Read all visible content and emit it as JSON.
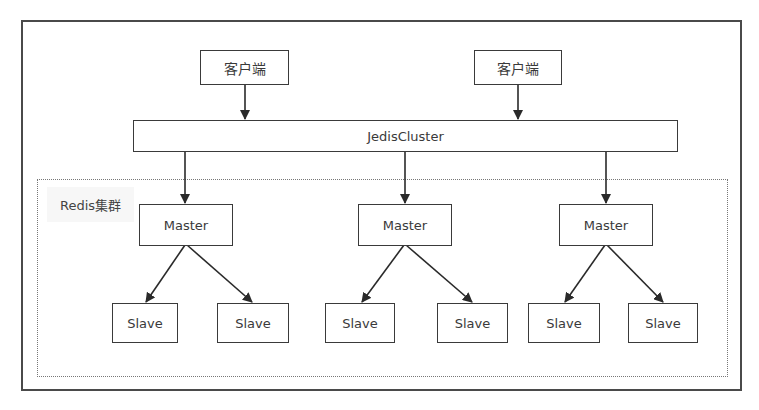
{
  "diagram": {
    "clients": [
      {
        "label": "客户端"
      },
      {
        "label": "客户端"
      }
    ],
    "cluster_client": {
      "label": "JedisCluster"
    },
    "cluster_group": {
      "label": "Redis集群"
    },
    "masters": [
      {
        "label": "Master",
        "slaves": [
          {
            "label": "Slave"
          },
          {
            "label": "Slave"
          }
        ]
      },
      {
        "label": "Master",
        "slaves": [
          {
            "label": "Slave"
          },
          {
            "label": "Slave"
          }
        ]
      },
      {
        "label": "Master",
        "slaves": [
          {
            "label": "Slave"
          },
          {
            "label": "Slave"
          }
        ]
      }
    ],
    "edges": [
      {
        "from": "客户端 (1)",
        "to": "JedisCluster"
      },
      {
        "from": "客户端 (2)",
        "to": "JedisCluster"
      },
      {
        "from": "JedisCluster",
        "to": "Master (1)"
      },
      {
        "from": "JedisCluster",
        "to": "Master (2)"
      },
      {
        "from": "JedisCluster",
        "to": "Master (3)"
      },
      {
        "from": "Master (1)",
        "to": "Slave (1)"
      },
      {
        "from": "Master (1)",
        "to": "Slave (2)"
      },
      {
        "from": "Master (2)",
        "to": "Slave (3)"
      },
      {
        "from": "Master (2)",
        "to": "Slave (4)"
      },
      {
        "from": "Master (3)",
        "to": "Slave (5)"
      },
      {
        "from": "Master (3)",
        "to": "Slave (6)"
      }
    ],
    "colors": {
      "stroke": "#3a3a3a",
      "group_border": "#777777",
      "label_bg": "#f7f7f7"
    }
  }
}
